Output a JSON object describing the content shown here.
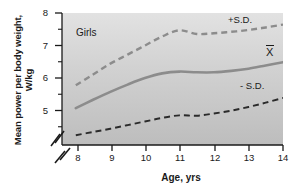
{
  "chart_data": {
    "type": "line",
    "title": "",
    "subtitle": "",
    "group_label": "Girls",
    "xlabel": "Age, yrs",
    "ylabel": "Mean power per body weight, W/kg",
    "xlim": [
      7.6,
      14
    ],
    "ylim": [
      4.35,
      8
    ],
    "xticks": [
      8,
      9,
      10,
      11,
      12,
      13,
      14
    ],
    "yticks": [
      5,
      6,
      7,
      8
    ],
    "xtick_labels": [
      "8",
      "9",
      "10",
      "11",
      "12",
      "13",
      "14"
    ],
    "ytick_labels": [
      "5",
      "6",
      "7",
      "8"
    ],
    "grid": false,
    "axis_break_x": true,
    "axis_break_y": true,
    "legend_position": "inline-right",
    "x": [
      8,
      8.5,
      9,
      9.5,
      10,
      10.5,
      11,
      11.5,
      12,
      12.5,
      13,
      13.5,
      14
    ],
    "series": [
      {
        "name": "+S.D.",
        "label": "+S.D.",
        "style": "dashed",
        "color": "#8c8c8c",
        "values": [
          6.0,
          6.3,
          6.6,
          6.85,
          7.1,
          7.35,
          7.52,
          7.42,
          7.44,
          7.48,
          7.53,
          7.6,
          7.68
        ]
      },
      {
        "name": "Mean",
        "label": "X̄",
        "style": "solid",
        "color": "#8c8c8c",
        "values": [
          5.37,
          5.6,
          5.82,
          6.02,
          6.2,
          6.33,
          6.38,
          6.36,
          6.36,
          6.4,
          6.46,
          6.55,
          6.64
        ]
      },
      {
        "name": "-S.D.",
        "label": "- S.D.",
        "style": "dashed",
        "color": "#2b2b2b",
        "values": [
          4.62,
          4.71,
          4.8,
          4.9,
          5.0,
          5.1,
          5.17,
          5.16,
          5.22,
          5.3,
          5.4,
          5.52,
          5.65
        ]
      }
    ],
    "annotations": [
      {
        "text": "Girls",
        "x": 8.4,
        "y": 7.6
      },
      {
        "text": "+S.D.",
        "x": 12.7,
        "y": 7.95
      },
      {
        "text": "X̄",
        "x": 13.6,
        "y": 7.0
      },
      {
        "text": "- S.D.",
        "x": 13.0,
        "y": 6.05
      }
    ]
  }
}
